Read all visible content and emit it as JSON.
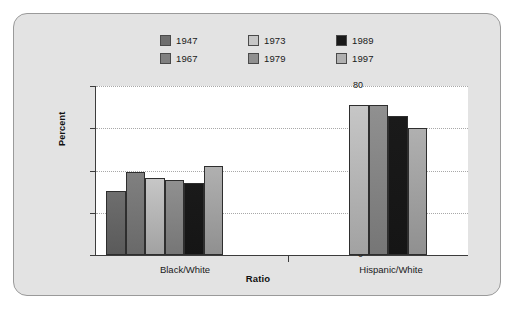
{
  "chart_data": {
    "type": "bar",
    "title": "",
    "xlabel": "Ratio",
    "ylabel": "Percent",
    "categories": [
      "Black/White",
      "Hispanic/White"
    ],
    "ylim": [
      0,
      80
    ],
    "yticks": [
      0,
      20,
      40,
      60,
      80
    ],
    "ytick_labels": [
      "0",
      "20",
      "40",
      "60",
      "80"
    ],
    "grid": true,
    "legend_position": "top-center",
    "series": [
      {
        "name": "1947",
        "color": "#6e6e6e",
        "values": [
          30.5,
          null
        ]
      },
      {
        "name": "1967",
        "color": "#808080",
        "values": [
          39.3,
          null
        ]
      },
      {
        "name": "1973",
        "color": "#c6c6c6",
        "values": [
          36.5,
          70.8
        ]
      },
      {
        "name": "1979",
        "color": "#909090",
        "values": [
          35.4,
          71.1
        ]
      },
      {
        "name": "1989",
        "color": "#1a1a1a",
        "values": [
          34.2,
          65.9
        ]
      },
      {
        "name": "1997",
        "color": "#b0b0b0",
        "values": [
          42.2,
          60.3
        ]
      }
    ]
  },
  "legend": {
    "items": [
      {
        "label": "1947",
        "color": "#6e6e6e"
      },
      {
        "label": "1967",
        "color": "#808080"
      },
      {
        "label": "1973",
        "color": "#c6c6c6"
      },
      {
        "label": "1979",
        "color": "#909090"
      },
      {
        "label": "1989",
        "color": "#1a1a1a"
      },
      {
        "label": "1997",
        "color": "#b0b0b0"
      }
    ]
  },
  "axes": {
    "y_title": "Percent",
    "x_title": "Ratio",
    "y_tick_labels": [
      "80",
      "60",
      "40",
      "20",
      "0"
    ],
    "x_group_labels": [
      "Black/White",
      "Hispanic/White"
    ]
  },
  "colors": {
    "card_background": "#e3e3e3",
    "card_border": "#9a9a9a",
    "plot_background": "#ffffff",
    "axis": "#3c3c3c",
    "gridline": "#a8a8a8",
    "text": "#1a1a1a"
  }
}
